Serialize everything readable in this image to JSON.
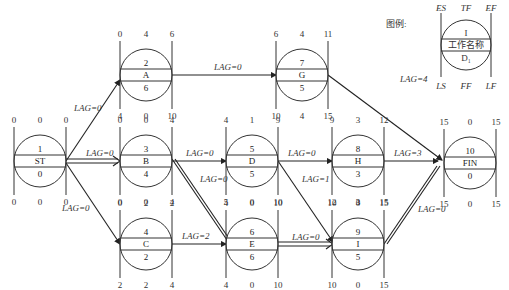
{
  "legend": {
    "title": "图例:",
    "top_labels": [
      "ES",
      "TF",
      "EF"
    ],
    "bottom_labels": [
      "LS",
      "FF",
      "LF"
    ],
    "rows": [
      "I",
      "工作名称",
      "D₁"
    ]
  },
  "nodes": [
    {
      "id": "ST",
      "num": "1",
      "name": "ST",
      "dur": "0",
      "es": "0",
      "tf": "0",
      "ef": "0",
      "ls": "0",
      "ff": "0",
      "lf": "0"
    },
    {
      "id": "A",
      "num": "2",
      "name": "A",
      "dur": "6",
      "es": "0",
      "tf": "4",
      "ef": "6",
      "ls": "4",
      "ff": "0",
      "lf": "10"
    },
    {
      "id": "B",
      "num": "3",
      "name": "B",
      "dur": "4",
      "es": "0",
      "tf": "0",
      "ef": "4",
      "ls": "0",
      "ff": "0",
      "lf": "4"
    },
    {
      "id": "C",
      "num": "4",
      "name": "C",
      "dur": "2",
      "es": "0",
      "tf": "2",
      "ef": "2",
      "ls": "2",
      "ff": "2",
      "lf": "4"
    },
    {
      "id": "D",
      "num": "5",
      "name": "D",
      "dur": "5",
      "es": "4",
      "tf": "1",
      "ef": "9",
      "ls": "5",
      "ff": "0",
      "lf": "10"
    },
    {
      "id": "E",
      "num": "6",
      "name": "E",
      "dur": "6",
      "es": "4",
      "tf": "0",
      "ef": "10",
      "ls": "4",
      "ff": "0",
      "lf": "10"
    },
    {
      "id": "G",
      "num": "7",
      "name": "G",
      "dur": "5",
      "es": "6",
      "tf": "4",
      "ef": "11",
      "ls": "10",
      "ff": "4",
      "lf": "15"
    },
    {
      "id": "H",
      "num": "8",
      "name": "H",
      "dur": "3",
      "es": "9",
      "tf": "3",
      "ef": "12",
      "ls": "12",
      "ff": "3",
      "lf": "15"
    },
    {
      "id": "I",
      "num": "9",
      "name": "I",
      "dur": "5",
      "es": "10",
      "tf": "0",
      "ef": "15",
      "ls": "10",
      "ff": "0",
      "lf": "15"
    },
    {
      "id": "FIN",
      "num": "10",
      "name": "FIN",
      "dur": "0",
      "es": "15",
      "tf": "0",
      "ef": "15",
      "ls": "15",
      "ff": "0",
      "lf": "15"
    }
  ],
  "links": [
    {
      "from": "ST",
      "to": "A",
      "lag": "LAG=0",
      "critical": false
    },
    {
      "from": "ST",
      "to": "B",
      "lag": "LAG=0",
      "critical": true
    },
    {
      "from": "ST",
      "to": "C",
      "lag": "LAG=0",
      "critical": false
    },
    {
      "from": "A",
      "to": "G",
      "lag": "LAG=0",
      "critical": false
    },
    {
      "from": "B",
      "to": "D",
      "lag": "LAG=0",
      "critical": false
    },
    {
      "from": "B",
      "to": "E",
      "lag": "LAG=0",
      "critical": true
    },
    {
      "from": "C",
      "to": "E",
      "lag": "LAG=2",
      "critical": false
    },
    {
      "from": "D",
      "to": "H",
      "lag": "LAG=0",
      "critical": false
    },
    {
      "from": "D",
      "to": "I",
      "lag": "LAG=1",
      "critical": false
    },
    {
      "from": "E",
      "to": "I",
      "lag": "LAG=0",
      "critical": true
    },
    {
      "from": "G",
      "to": "FIN",
      "lag": "LAG=4",
      "critical": false
    },
    {
      "from": "H",
      "to": "FIN",
      "lag": "LAG=3",
      "critical": false
    },
    {
      "from": "I",
      "to": "FIN",
      "lag": "LAG=0",
      "critical": true
    }
  ]
}
